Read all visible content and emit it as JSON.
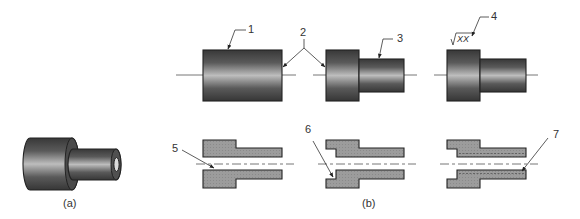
{
  "figure": {
    "panel_a_label": "(a)",
    "panel_b_label": "(b)",
    "colors": {
      "part_dark": "#3a3a3a",
      "part_highlight": "#b8b8b8",
      "section_fill": "#9a9a9a",
      "outline": "#222222",
      "text": "#333333"
    }
  },
  "callouts": [
    {
      "id": "1",
      "label": "1"
    },
    {
      "id": "2",
      "label": "2"
    },
    {
      "id": "3",
      "label": "3"
    },
    {
      "id": "4",
      "label": "4"
    },
    {
      "id": "5",
      "label": "5"
    },
    {
      "id": "6",
      "label": "6"
    },
    {
      "id": "7",
      "label": "7"
    }
  ],
  "surface_symbol": {
    "text": "XX"
  }
}
